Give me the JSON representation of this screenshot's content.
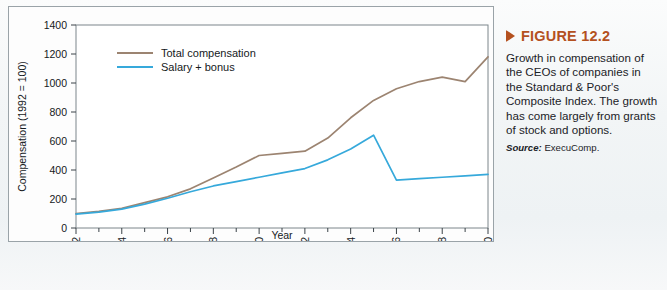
{
  "figure": {
    "bullet_icon": "triangle-right-icon",
    "title": "FIGURE 12.2",
    "body": "Growth in compensation of the CEOs of companies in the Standard & Poor's Composite Index. The growth has come largely from grants of stock and options.",
    "source_label": "Source:",
    "source_value": "ExecuComp.",
    "title_color": "#b4511f"
  },
  "chart_data": {
    "type": "line",
    "title": "",
    "xlabel": "Year",
    "ylabel": "Compensation (1992 = 100)",
    "xlim": [
      1992,
      2010
    ],
    "ylim": [
      0,
      1400
    ],
    "ytick_step": 200,
    "ytick_labels": [
      "0",
      "200",
      "400",
      "600",
      "800",
      "1000",
      "1200",
      "1400"
    ],
    "ytick_values": [
      0,
      200,
      400,
      600,
      800,
      1000,
      1200,
      1400
    ],
    "xtick_labels": [
      "1992",
      "1994",
      "1996",
      "1998",
      "2000",
      "2002",
      "2004",
      "2006",
      "2008",
      "2010"
    ],
    "xtick_values": [
      1992,
      1994,
      1996,
      1998,
      2000,
      2002,
      2004,
      2006,
      2008,
      2010
    ],
    "xminor_values": [
      1993,
      1995,
      1997,
      1999,
      2001,
      2003,
      2005,
      2007,
      2009
    ],
    "xtick_rotation": -90,
    "grid": false,
    "legend_position": "upper-left-inside",
    "x": [
      1992,
      1993,
      1994,
      1995,
      1996,
      1997,
      1998,
      1999,
      2000,
      2001,
      2002,
      2003,
      2004,
      2005,
      2006,
      2007,
      2008,
      2009,
      2010
    ],
    "series": [
      {
        "name": "Total compensation",
        "color": "#9c8471",
        "values": [
          100,
          115,
          135,
          175,
          215,
          270,
          345,
          420,
          500,
          515,
          530,
          620,
          760,
          880,
          960,
          1010,
          1040,
          1010,
          1180
        ]
      },
      {
        "name": "Salary + bonus",
        "color": "#36a9db",
        "values": [
          95,
          110,
          130,
          165,
          205,
          250,
          290,
          320,
          350,
          380,
          410,
          470,
          545,
          640,
          330,
          340,
          350,
          360,
          370
        ]
      }
    ]
  }
}
